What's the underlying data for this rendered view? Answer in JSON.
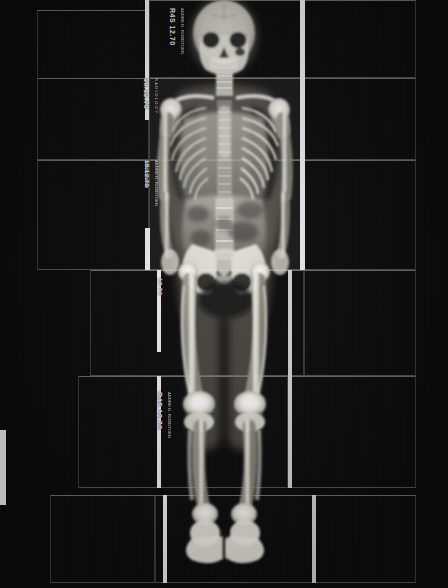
{
  "image": {
    "kind": "radiograph-composite",
    "title": "Full-body radiograph composite",
    "subject": "anterior-posterior whole body skeleton",
    "background_color": "#0a0a0a",
    "film_color": "#141414",
    "bone_color": "#f2f0ea",
    "strip_color": "#f2f2f2",
    "width": 448,
    "height": 588
  },
  "stamps": [
    {
      "id": "stamp-skull",
      "text": "R4S 12.70",
      "sub": "ANDRE D. ROENTGEN",
      "x": 176,
      "y": 8,
      "size": 7
    },
    {
      "id": "stamp-thorax",
      "text": "18.12.70",
      "sub": "R A D I O L O G Y",
      "x": 150,
      "y": 78,
      "size": 7
    },
    {
      "id": "stamp-abdomen",
      "text": "18.12.70",
      "sub": "ANDRE D. ROENTGEN",
      "x": 150,
      "y": 160,
      "size": 6
    },
    {
      "id": "stamp-pelvis",
      "text": "12.70",
      "sub": "",
      "x": 163,
      "y": 278,
      "size": 6
    },
    {
      "id": "stamp-knee",
      "text": "R4S 12.70",
      "sub": "ANDRE D. ROENTGEN",
      "x": 163,
      "y": 392,
      "size": 7
    }
  ],
  "panels": [
    {
      "id": "panel-head-left",
      "x": 37,
      "y": 10,
      "w": 112,
      "h": 133,
      "tone": "dark"
    },
    {
      "id": "panel-head-center",
      "x": 149,
      "y": 0,
      "w": 155,
      "h": 78,
      "tone": "dark"
    },
    {
      "id": "panel-head-right",
      "x": 304,
      "y": 0,
      "w": 112,
      "h": 78,
      "tone": "dark"
    },
    {
      "id": "panel-thorax-left",
      "x": 37,
      "y": 78,
      "w": 112,
      "h": 82,
      "tone": "dark"
    },
    {
      "id": "panel-thorax-mid",
      "x": 149,
      "y": 78,
      "w": 155,
      "h": 82,
      "tone": "lit"
    },
    {
      "id": "panel-thorax-right",
      "x": 304,
      "y": 78,
      "w": 112,
      "h": 82,
      "tone": "dark"
    },
    {
      "id": "panel-abdomen-left",
      "x": 37,
      "y": 160,
      "w": 112,
      "h": 110,
      "tone": "dark"
    },
    {
      "id": "panel-abdomen-mid",
      "x": 149,
      "y": 160,
      "w": 155,
      "h": 110,
      "tone": "lit"
    },
    {
      "id": "panel-abdomen-right",
      "x": 304,
      "y": 160,
      "w": 112,
      "h": 110,
      "tone": "dark"
    },
    {
      "id": "panel-pelvis-mid",
      "x": 90,
      "y": 270,
      "w": 214,
      "h": 106,
      "tone": "dark"
    },
    {
      "id": "panel-pelvis-right",
      "x": 304,
      "y": 270,
      "w": 112,
      "h": 106,
      "tone": "dark"
    },
    {
      "id": "panel-thigh-left",
      "x": 78,
      "y": 376,
      "w": 82,
      "h": 112,
      "tone": "dark"
    },
    {
      "id": "panel-thigh-mid",
      "x": 160,
      "y": 376,
      "w": 128,
      "h": 112,
      "tone": "dark"
    },
    {
      "id": "panel-thigh-right",
      "x": 288,
      "y": 376,
      "w": 128,
      "h": 112,
      "tone": "dark"
    },
    {
      "id": "panel-foot-left",
      "x": 50,
      "y": 495,
      "w": 105,
      "h": 88,
      "tone": "dark"
    },
    {
      "id": "panel-foot-mid",
      "x": 155,
      "y": 495,
      "w": 160,
      "h": 88,
      "tone": "dark"
    },
    {
      "id": "panel-foot-right",
      "x": 315,
      "y": 495,
      "w": 101,
      "h": 88,
      "tone": "dark"
    }
  ],
  "strips": [
    {
      "id": "strip-left-head",
      "x": 145,
      "y": 0,
      "w": 4,
      "h": 78,
      "tone": "bright"
    },
    {
      "id": "strip-left-thorax",
      "x": 145,
      "y": 78,
      "w": 4,
      "h": 42,
      "tone": "bright"
    },
    {
      "id": "strip-left-abd",
      "x": 145,
      "y": 160,
      "w": 3,
      "h": 28,
      "tone": "faint"
    },
    {
      "id": "strip-left-pelvis",
      "x": 145,
      "y": 228,
      "w": 5,
      "h": 42,
      "tone": "bright"
    },
    {
      "id": "strip-left-thigh",
      "x": 157,
      "y": 270,
      "w": 4,
      "h": 82,
      "tone": "bright"
    },
    {
      "id": "strip-left-knee",
      "x": 157,
      "y": 376,
      "w": 4,
      "h": 112,
      "tone": "bright"
    },
    {
      "id": "strip-left-foot",
      "x": 163,
      "y": 495,
      "w": 4,
      "h": 88,
      "tone": "bright"
    },
    {
      "id": "strip-right-head",
      "x": 300,
      "y": 0,
      "w": 5,
      "h": 78,
      "tone": "bright"
    },
    {
      "id": "strip-right-thx",
      "x": 300,
      "y": 78,
      "w": 5,
      "h": 82,
      "tone": "bright"
    },
    {
      "id": "strip-right-abd",
      "x": 300,
      "y": 160,
      "w": 5,
      "h": 110,
      "tone": "bright"
    },
    {
      "id": "strip-right-pelv",
      "x": 288,
      "y": 270,
      "w": 4,
      "h": 106,
      "tone": "dim"
    },
    {
      "id": "strip-right-thigh",
      "x": 288,
      "y": 376,
      "w": 4,
      "h": 112,
      "tone": "dim"
    },
    {
      "id": "strip-right-foot",
      "x": 312,
      "y": 495,
      "w": 4,
      "h": 88,
      "tone": "dim"
    },
    {
      "id": "strip-far-left",
      "x": 0,
      "y": 430,
      "w": 6,
      "h": 75,
      "tone": "bright"
    }
  ],
  "meta": {
    "alt": "Composite anterior-posterior full body X-ray assembled from overlapping radiographic film panels showing skull, thorax, spine, ribs, pelvis, femurs, tibiae and feet.",
    "date_stamp_primary": "18.12.70",
    "date_stamp_secondary": "R4S 12.70"
  }
}
